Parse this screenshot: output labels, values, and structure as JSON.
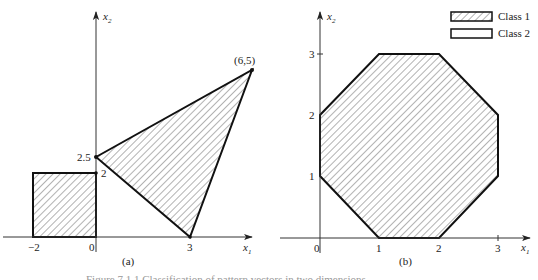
{
  "figure": {
    "caption": "Figure 7.1.1  Classification of pattern vectors in two dimensions",
    "colors": {
      "stroke": "#111111",
      "axis": "#444444",
      "hatch": "#555555",
      "background": "#ffffff"
    }
  },
  "legend": {
    "items": [
      {
        "label": "Class 1",
        "fill": "hatched"
      },
      {
        "label": "Class 2",
        "fill": "empty"
      }
    ]
  },
  "panels": [
    {
      "id": "a",
      "label": "(a)",
      "axes": {
        "x_label": "x",
        "x_sub": "1",
        "y_label": "x",
        "y_sub": "2"
      },
      "x_ticks": [
        "−2",
        "0",
        "3"
      ],
      "y_ticks": [
        "2.5",
        "2"
      ],
      "point_label": "(6,5)",
      "regions": [
        {
          "name": "square",
          "class": "Class 1",
          "vertices": [
            [
              -2,
              0
            ],
            [
              0,
              0
            ],
            [
              0,
              2
            ],
            [
              -2,
              2
            ]
          ]
        },
        {
          "name": "triangle",
          "class": "Class 1",
          "vertices": [
            [
              0,
              2.5
            ],
            [
              6,
              5
            ],
            [
              3,
              0
            ]
          ]
        }
      ]
    },
    {
      "id": "b",
      "label": "(b)",
      "axes": {
        "x_label": "x",
        "x_sub": "1",
        "y_label": "x",
        "y_sub": "2"
      },
      "x_ticks": [
        "0",
        "1",
        "2",
        "3"
      ],
      "y_ticks": [
        "1",
        "2",
        "3"
      ],
      "regions": [
        {
          "name": "octagon",
          "class": "Class 1",
          "vertices": [
            [
              1,
              0
            ],
            [
              2,
              0
            ],
            [
              3,
              1
            ],
            [
              3,
              2
            ],
            [
              2,
              3
            ],
            [
              1,
              3
            ],
            [
              0,
              2
            ],
            [
              0,
              1
            ]
          ]
        }
      ]
    }
  ]
}
